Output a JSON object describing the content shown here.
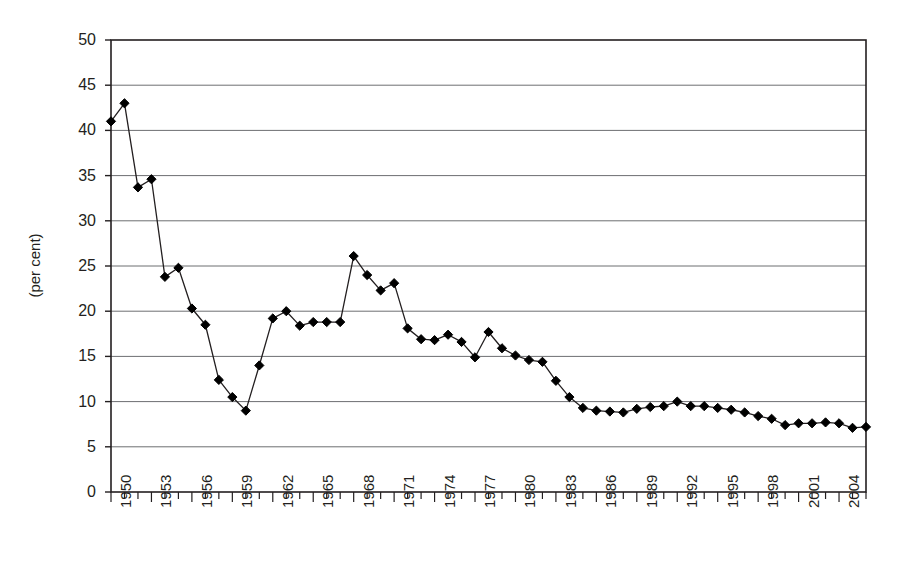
{
  "chart_data": {
    "type": "line",
    "title": "",
    "subtitle": "",
    "xlabel": "",
    "ylabel": "(per cent)",
    "ylim": [
      0,
      50
    ],
    "ytick_step": 5,
    "yticks": [
      0,
      5,
      10,
      15,
      20,
      25,
      30,
      35,
      40,
      45,
      50
    ],
    "xlim": [
      1950,
      2006
    ],
    "xtick_labels": [
      "1950",
      "1953",
      "1956",
      "1959",
      "1962",
      "1965",
      "1968",
      "1971",
      "1974",
      "1977",
      "1980",
      "1983",
      "1986",
      "1989",
      "1992",
      "1995",
      "1998",
      "2001",
      "2004"
    ],
    "xtick_label_step": 3,
    "grid": "horizontal",
    "legend": "none",
    "marker": "diamond",
    "series_color": "#000000",
    "line_color": "#231f20",
    "x": [
      1950,
      1951,
      1952,
      1953,
      1954,
      1955,
      1956,
      1957,
      1958,
      1959,
      1960,
      1961,
      1962,
      1963,
      1964,
      1965,
      1966,
      1967,
      1968,
      1969,
      1970,
      1971,
      1972,
      1973,
      1974,
      1975,
      1976,
      1977,
      1978,
      1979,
      1980,
      1981,
      1982,
      1983,
      1984,
      1985,
      1986,
      1987,
      1988,
      1989,
      1990,
      1991,
      1992,
      1993,
      1994,
      1995,
      1996,
      1997,
      1998,
      1999,
      2000,
      2001,
      2002,
      2003,
      2004,
      2005,
      2006
    ],
    "values": [
      41.0,
      43.0,
      33.7,
      34.6,
      23.8,
      24.8,
      20.3,
      18.5,
      12.4,
      10.5,
      9.0,
      14.0,
      19.2,
      20.0,
      18.4,
      18.8,
      18.8,
      18.8,
      26.1,
      24.0,
      22.3,
      23.1,
      18.1,
      16.9,
      16.8,
      17.4,
      16.6,
      14.9,
      17.7,
      15.9,
      15.1,
      14.6,
      14.4,
      12.3,
      10.5,
      9.3,
      9.0,
      8.9,
      8.8,
      9.2,
      9.4,
      9.5,
      10.0,
      9.5,
      9.5,
      9.3,
      9.1,
      8.8,
      8.4,
      8.1,
      7.4,
      7.6,
      7.6,
      7.7,
      7.6,
      7.1,
      7.2
    ],
    "series": [
      {
        "name": "series-1",
        "values": [
          41.0,
          43.0,
          33.7,
          34.6,
          23.8,
          24.8,
          20.3,
          18.5,
          12.4,
          10.5,
          9.0,
          14.0,
          19.2,
          20.0,
          18.4,
          18.8,
          18.8,
          18.8,
          26.1,
          24.0,
          22.3,
          23.1,
          18.1,
          16.9,
          16.8,
          17.4,
          16.6,
          14.9,
          17.7,
          15.9,
          15.1,
          14.6,
          14.4,
          12.3,
          10.5,
          9.3,
          9.0,
          8.9,
          8.8,
          9.2,
          9.4,
          9.5,
          10.0,
          9.5,
          9.5,
          9.3,
          9.1,
          8.8,
          8.4,
          8.1,
          7.4,
          7.6,
          7.6,
          7.7,
          7.6,
          7.1,
          7.2
        ]
      }
    ]
  }
}
